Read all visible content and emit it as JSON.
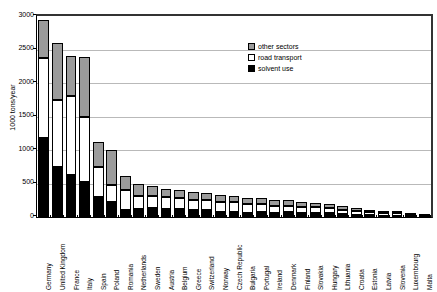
{
  "chart_data": {
    "type": "bar",
    "subtype": "stacked-bar",
    "title": "",
    "xlabel": "",
    "ylabel": "1000 tons/year",
    "ylim": [
      0,
      3000
    ],
    "ytick_step": 500,
    "yticks": [
      0,
      500,
      1000,
      1500,
      2000,
      2500,
      3000
    ],
    "ytick_labels": [
      "0",
      "500",
      "1000",
      "1500",
      "2000",
      "2500",
      "3000"
    ],
    "grid": true,
    "grid_axis": "y",
    "legend_position": "upper-right-inside",
    "categories": [
      "Germany",
      "United Kingdom",
      "France",
      "Italy",
      "Spain",
      "Poland",
      "Romania",
      "Netherlands",
      "Sweden",
      "Austria",
      "Belgium",
      "Greece",
      "Switzerland",
      "Norway",
      "Czech Republic",
      "Bulgaria",
      "Portugal",
      "Ireland",
      "Denmark",
      "Finland",
      "Slovakia",
      "Hungary",
      "Lithuania",
      "Croatia",
      "Estonia",
      "Latvia",
      "Slovenia",
      "Luxembourg",
      "Malta"
    ],
    "series": [
      {
        "name": "solvent use",
        "color": "#000000",
        "values": [
          1180,
          750,
          630,
          530,
          300,
          230,
          110,
          120,
          130,
          120,
          120,
          110,
          110,
          80,
          80,
          60,
          70,
          60,
          70,
          60,
          60,
          60,
          40,
          35,
          25,
          20,
          20,
          10,
          5
        ]
      },
      {
        "name": "road transport",
        "color": "#ffffff",
        "values": [
          1200,
          990,
          1170,
          970,
          450,
          250,
          300,
          200,
          180,
          180,
          160,
          150,
          140,
          150,
          140,
          130,
          120,
          110,
          100,
          95,
          85,
          80,
          70,
          60,
          45,
          40,
          35,
          20,
          10
        ]
      },
      {
        "name": "other sectors",
        "color": "#9b9b9b",
        "values": [
          560,
          860,
          600,
          890,
          370,
          520,
          200,
          180,
          150,
          120,
          120,
          120,
          110,
          100,
          95,
          100,
          90,
          85,
          80,
          70,
          65,
          55,
          50,
          45,
          35,
          25,
          20,
          10,
          5
        ]
      }
    ],
    "totals": [
      2940,
      2600,
      2400,
      2390,
      1120,
      1000,
      610,
      500,
      460,
      420,
      400,
      380,
      360,
      330,
      315,
      290,
      280,
      255,
      250,
      225,
      210,
      195,
      160,
      140,
      105,
      85,
      75,
      40,
      20
    ]
  },
  "legend": {
    "items": [
      {
        "label": "other sectors",
        "swatch": "gray-swatch-icon"
      },
      {
        "label": "road transport",
        "swatch": "white-swatch-icon"
      },
      {
        "label": "solvent use",
        "swatch": "black-swatch-icon"
      }
    ]
  }
}
